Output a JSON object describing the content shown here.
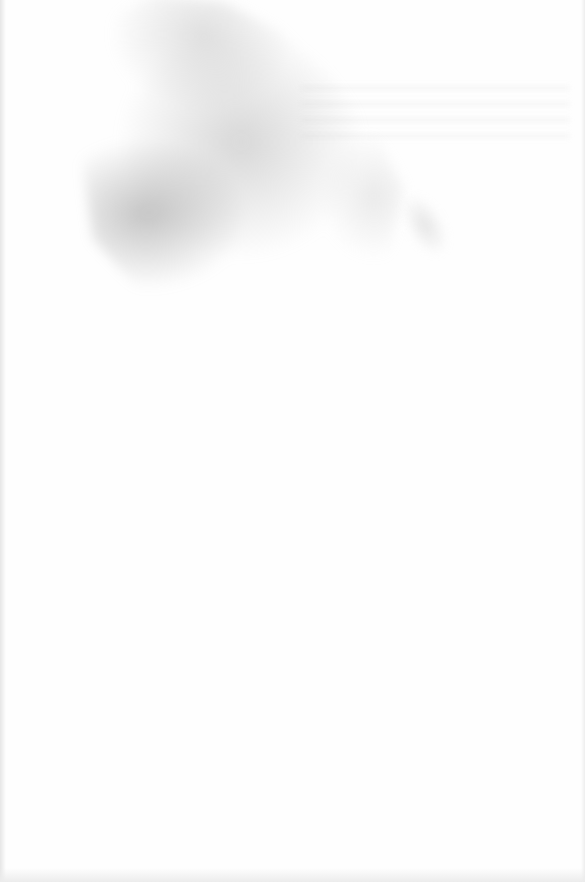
{
  "document": {
    "type": "scanned-page",
    "text": "",
    "visible_marks": [
      {
        "kind": "stain",
        "description": "grey smudge in upper-left area"
      },
      {
        "kind": "bleed-through",
        "description": "faint illegible traces near top right"
      }
    ],
    "colors": {
      "paper": "#fefefe",
      "stain": "#b9b9b9",
      "edge_shadow": "#e6e6e6"
    }
  }
}
